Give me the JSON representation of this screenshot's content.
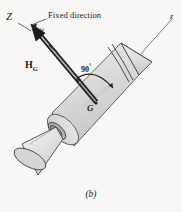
{
  "figure": {
    "caption": "(b)",
    "background_color": "#f8f7f5",
    "body_fill": "#d9d9d7",
    "body_fill_light": "#e9e9e7",
    "body_fill_dark": "#c2c2c0",
    "stroke_color": "#3a3a3a",
    "labels": {
      "axis_Z": "Z",
      "axis_z": "z",
      "fixed_direction": "Fixed direction",
      "omega": "ω",
      "angular_momentum": "H",
      "angular_momentum_sub": "G",
      "right_angle": "90",
      "degree_symbol": "°",
      "center_of_mass": "G"
    },
    "annotations": {
      "angle_value_deg": 90,
      "angle_between": "H_G and z axis"
    },
    "shapes": [
      {
        "name": "rocket-body-cylinder",
        "type": "cylinder"
      },
      {
        "name": "nose-cone",
        "type": "cone"
      },
      {
        "name": "nozzle-cone",
        "type": "cone"
      },
      {
        "name": "nozzle-throat-ellipse",
        "type": "ellipse"
      }
    ]
  }
}
